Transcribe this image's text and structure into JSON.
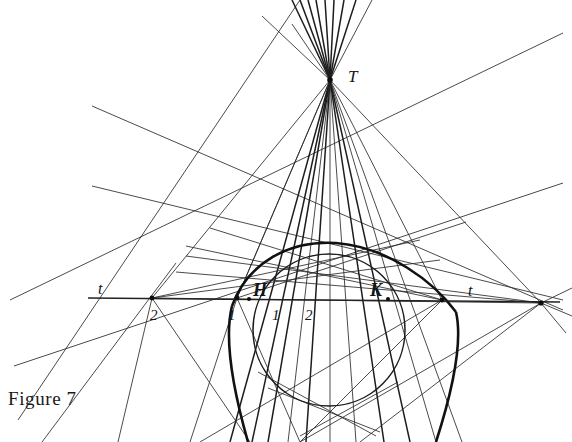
{
  "figure": {
    "caption": "Figure 7",
    "background_color": "#ffffff",
    "ink_color": "#111111",
    "width": 572,
    "height": 442
  },
  "labels": {
    "apex": "T",
    "tangent_line_left": "t",
    "tangent_line_right": "t",
    "point_left_outer": "2",
    "point_left_inner": "1",
    "mark_inner_1": "1",
    "mark_inner_2": "2",
    "conic_point_left": "H",
    "conic_point_right": "K"
  },
  "label_positions": {
    "apex": {
      "x": 348,
      "y": 82
    },
    "tangent_line_left": {
      "x": 98,
      "y": 294
    },
    "tangent_line_right": {
      "x": 468,
      "y": 296
    },
    "point_left_outer": {
      "x": 150,
      "y": 320
    },
    "point_left_inner": {
      "x": 228,
      "y": 320
    },
    "mark_inner_1": {
      "x": 272,
      "y": 320
    },
    "mark_inner_2": {
      "x": 305,
      "y": 320
    },
    "conic_point_left": {
      "x": 253,
      "y": 296
    },
    "conic_point_right": {
      "x": 370,
      "y": 296
    }
  },
  "geometry": {
    "apex_point": {
      "x": 330,
      "y": 80
    },
    "baseline_y": 298,
    "baseline": {
      "x1": 88,
      "y1": 298,
      "x2": 560,
      "y2": 302
    },
    "circle": {
      "cx": 329,
      "cy": 330,
      "r": 76
    },
    "conic_arc": "M 238,302 C 262,252 300,240 340,244 C 392,249 432,283 452,309",
    "nodes": [
      {
        "name": "left-outer-node",
        "x": 152,
        "y": 298
      },
      {
        "name": "left-inner-node",
        "x": 237,
        "y": 298
      },
      {
        "name": "conic-left-node",
        "x": 249,
        "y": 299
      },
      {
        "name": "conic-right-node",
        "x": 388,
        "y": 299
      },
      {
        "name": "right-node",
        "x": 442,
        "y": 300
      },
      {
        "name": "far-right-node",
        "x": 541,
        "y": 303
      },
      {
        "name": "apex-node",
        "x": 330,
        "y": 80
      }
    ],
    "fan_from_apex": [
      {
        "x": 230,
        "y": 442
      },
      {
        "x": 248,
        "y": 442
      },
      {
        "x": 262,
        "y": 442
      },
      {
        "x": 282,
        "y": 442
      },
      {
        "x": 300,
        "y": 442
      },
      {
        "x": 330,
        "y": 442
      },
      {
        "x": 360,
        "y": 442
      },
      {
        "x": 385,
        "y": 442
      },
      {
        "x": 408,
        "y": 442
      },
      {
        "x": 430,
        "y": 442
      },
      {
        "x": 455,
        "y": 442
      }
    ],
    "fan_above_apex": [
      {
        "x": 290,
        "y": 0
      },
      {
        "x": 300,
        "y": 0
      },
      {
        "x": 310,
        "y": 0
      },
      {
        "x": 320,
        "y": 0
      },
      {
        "x": 330,
        "y": 0
      },
      {
        "x": 340,
        "y": 0
      },
      {
        "x": 350,
        "y": 0
      },
      {
        "x": 362,
        "y": 0
      },
      {
        "x": 374,
        "y": 0
      }
    ]
  }
}
